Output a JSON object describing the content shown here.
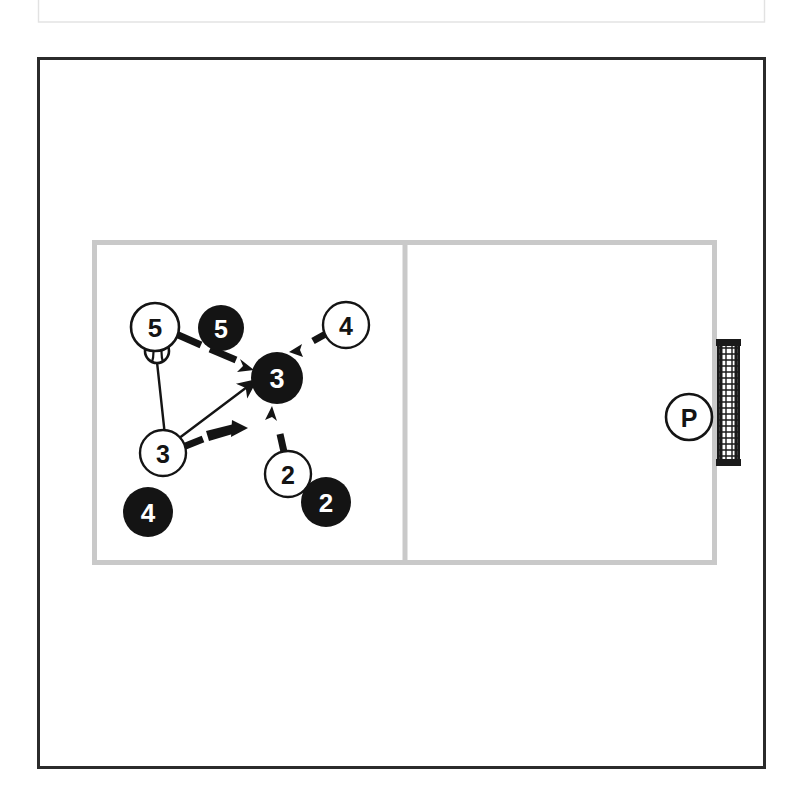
{
  "page": {
    "width": 809,
    "height": 811,
    "background": "#ffffff"
  },
  "colors": {
    "ink": "#1a1a1a",
    "court_line": "#c9c9c9",
    "frame": "#2b2b2b",
    "header_box": "#e6e6e6",
    "white_fill": "#ffffff",
    "black_fill": "#141414",
    "net_dark": "#1a1a1a",
    "net_light": "#ffffff"
  },
  "header_box": {
    "name": "top-thin-box",
    "x": 37,
    "y": 0,
    "width": 728,
    "height": 22,
    "stroke": "#e0e0e0"
  },
  "frame": {
    "name": "outer-frame",
    "x": 37,
    "y": 57,
    "width": 728,
    "height": 711,
    "stroke": "#2b2b2b",
    "stroke_width": 3
  },
  "court": {
    "name": "court-outline",
    "x": 92,
    "y": 240,
    "width": 623,
    "height": 323,
    "stroke": "#c9c9c9",
    "stroke_width": 5,
    "center_line_x": 405,
    "halves": [
      "left-half",
      "right-half"
    ]
  },
  "net": {
    "name": "net",
    "x": 718,
    "y": 340,
    "width": 22,
    "height": 126,
    "mesh_rows": 22,
    "band_thickness": 6
  },
  "ball": {
    "name": "volleyball",
    "cx": 157,
    "cy": 351,
    "r": 12
  },
  "markers": [
    {
      "id": "white-5",
      "name": "player-marker-white-5",
      "label": "5",
      "style": "white",
      "cx": 155,
      "cy": 327,
      "r": 24
    },
    {
      "id": "black-5",
      "name": "player-marker-black-5",
      "label": "5",
      "style": "black",
      "cx": 221,
      "cy": 328,
      "r": 23
    },
    {
      "id": "white-4-top",
      "name": "player-marker-white-4",
      "label": "4",
      "style": "white",
      "cx": 346,
      "cy": 325,
      "r": 23
    },
    {
      "id": "black-3",
      "name": "player-marker-black-3",
      "label": "3",
      "style": "black",
      "cx": 277,
      "cy": 378,
      "r": 26
    },
    {
      "id": "white-3",
      "name": "player-marker-white-3",
      "label": "3",
      "style": "white",
      "cx": 163,
      "cy": 453,
      "r": 23
    },
    {
      "id": "black-4",
      "name": "player-marker-black-4",
      "label": "4",
      "style": "black",
      "cx": 148,
      "cy": 512,
      "r": 25
    },
    {
      "id": "white-2",
      "name": "player-marker-white-2",
      "label": "2",
      "style": "white",
      "cx": 288,
      "cy": 474,
      "r": 23
    },
    {
      "id": "black-2",
      "name": "player-marker-black-2",
      "label": "2",
      "style": "black",
      "cx": 326,
      "cy": 502,
      "r": 25
    },
    {
      "id": "white-p",
      "name": "player-marker-white-p",
      "label": "P",
      "style": "white",
      "cx": 689,
      "cy": 417,
      "r": 23
    }
  ],
  "arrows": [
    {
      "id": "pass-ball-to-3",
      "name": "pass-line-ball-to-white-3",
      "kind": "solid-line",
      "x1": 157,
      "y1": 363,
      "x2": 166,
      "y2": 444,
      "arrowhead": false
    },
    {
      "id": "set-3-to-3",
      "name": "set-arrow-white3-to-black3",
      "kind": "solid-arrow",
      "x1": 166,
      "y1": 447,
      "x2": 258,
      "y2": 378,
      "arrowhead": true
    },
    {
      "id": "move-5-to-3",
      "name": "movement-arrow-5-to-3",
      "kind": "dashed-arrow",
      "x1": 180,
      "y1": 337,
      "x2": 248,
      "y2": 366,
      "arrowhead": true
    },
    {
      "id": "move-4-to-3",
      "name": "movement-arrow-4-to-3",
      "kind": "dashed-arrow",
      "x1": 330,
      "y1": 334,
      "x2": 293,
      "y2": 353,
      "arrowhead": true
    },
    {
      "id": "move-2-to-3",
      "name": "movement-arrow-2-to-3",
      "kind": "dashed-arrow",
      "x1": 285,
      "y1": 452,
      "x2": 272,
      "y2": 408,
      "arrowhead": true
    },
    {
      "id": "move-3-right",
      "name": "movement-arrow-white3-right",
      "kind": "dashed-arrow",
      "x1": 184,
      "y1": 448,
      "x2": 236,
      "y2": 429,
      "arrowhead": true
    }
  ]
}
